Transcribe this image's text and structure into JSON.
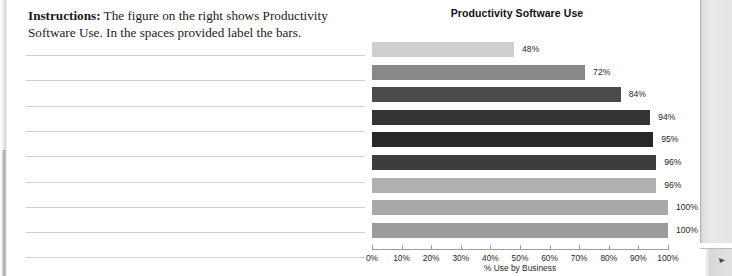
{
  "worksheet": {
    "instructions_label": "Instructions:",
    "instructions_text": " The figure on the right shows Productivity Software Use.  In the spaces provided label the bars.",
    "answer_line_count": 9
  },
  "chart_data": {
    "type": "bar",
    "orientation": "horizontal",
    "title": "Productivity Software Use",
    "xlabel": "% Use by Business",
    "ylabel": "",
    "xlim": [
      0,
      100
    ],
    "grid": false,
    "legend": null,
    "categories": [
      "",
      "",
      "",
      "",
      "",
      "",
      "",
      "",
      ""
    ],
    "values": [
      48,
      72,
      84,
      94,
      95,
      96,
      96,
      100,
      100
    ],
    "data_labels": [
      "48%",
      "72%",
      "84%",
      "94%",
      "95%",
      "96%",
      "96%",
      "100%",
      "100%"
    ],
    "bar_colors": [
      "#cfcfcf",
      "#888888",
      "#4b4b4b",
      "#343434",
      "#282828",
      "#3d3d3d",
      "#b0b0b0",
      "#a8a8a8",
      "#9c9c9c"
    ],
    "tick_labels": [
      "0%",
      "10%",
      "20%",
      "30%",
      "40%",
      "50%",
      "60%",
      "70%",
      "80%",
      "90%",
      "100%"
    ],
    "tick_values": [
      0,
      10,
      20,
      30,
      40,
      50,
      60,
      70,
      80,
      90,
      100
    ]
  },
  "style": {
    "axis_color": "#9d9d9d",
    "rule_line_color": "#cfcfcf",
    "text_color": "#1f1f1f"
  }
}
